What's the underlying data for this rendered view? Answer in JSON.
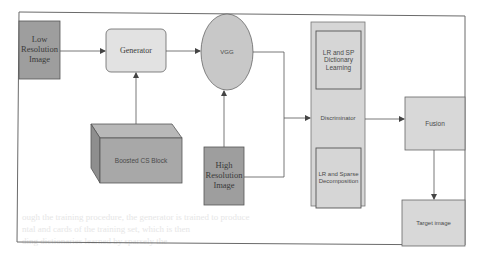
{
  "diagram": {
    "nodes": {
      "low_res_image": {
        "label_lines": [
          "Low",
          "Resolution",
          "Image"
        ],
        "fill": "#9e9e9e"
      },
      "generator": {
        "label": "Generator",
        "fill": "#e2e2e2"
      },
      "vgg": {
        "label": "VGG",
        "fill": "#c8c8c8"
      },
      "boosted_cs_block": {
        "label": "Boosted CS Block",
        "fill": "#a8a8a8"
      },
      "high_res_image": {
        "label_lines": [
          "High",
          "Resolution",
          "Image"
        ],
        "fill": "#9e9e9e"
      },
      "discriminator": {
        "label": "Discriminator",
        "fill": "#d6d6d6"
      },
      "lr_sp_dictionary": {
        "label_lines": [
          "LR and SP",
          "Dictionary",
          "Learning"
        ],
        "fill": "#d6d6d6"
      },
      "lr_sparse_decomposition": {
        "label_lines": [
          "LR and Sparse",
          "Decomposition"
        ],
        "fill": "#d6d6d6"
      },
      "fusion": {
        "label": "Fusion",
        "fill": "#d8d8d8"
      },
      "target_image": {
        "label": "Target image",
        "fill": "#d8d8d8"
      }
    },
    "edges": [
      {
        "from": "low_res_image",
        "to": "generator"
      },
      {
        "from": "boosted_cs_block",
        "to": "generator"
      },
      {
        "from": "generator",
        "to": "vgg"
      },
      {
        "from": "high_res_image",
        "to": "vgg"
      },
      {
        "from": "vgg",
        "to": "discriminator"
      },
      {
        "from": "high_res_image",
        "to": "discriminator"
      },
      {
        "from": "discriminator",
        "to": "fusion"
      },
      {
        "from": "fusion",
        "to": "target_image"
      }
    ],
    "colors": {
      "line": "#555555",
      "frame": "#6a6a6a",
      "background": "#ffffff"
    }
  }
}
